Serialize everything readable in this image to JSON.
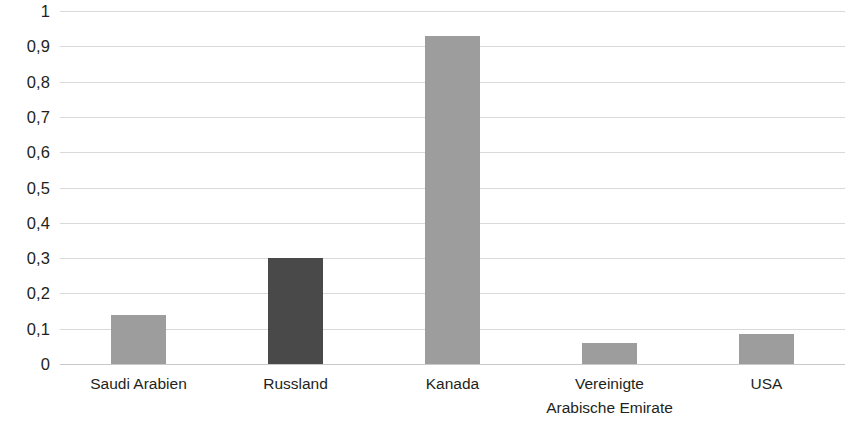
{
  "chart_data": {
    "type": "bar",
    "title": "",
    "subtitle": "",
    "xlabel": "",
    "ylabel": "",
    "categories": [
      "Saudi Arabien",
      "Russland",
      "Kanada",
      "Vereinigte Arabische Emirate",
      "USA"
    ],
    "category_lines": [
      [
        "Saudi Arabien"
      ],
      [
        "Russland"
      ],
      [
        "Kanada"
      ],
      [
        "Vereinigte",
        "Arabische Emirate"
      ],
      [
        "USA"
      ]
    ],
    "values": [
      0.14,
      0.3,
      0.93,
      0.06,
      0.085
    ],
    "bar_colors": [
      "#9d9d9d",
      "#494949",
      "#9d9d9d",
      "#9d9d9d",
      "#9d9d9d"
    ],
    "ylim": [
      0,
      1
    ],
    "ytick_values": [
      1,
      0.9,
      0.8,
      0.7,
      0.6,
      0.5,
      0.4,
      0.3,
      0.2,
      0.1,
      0
    ],
    "ytick_labels": [
      "1",
      "0,9",
      "0,8",
      "0,7",
      "0,6",
      "0,5",
      "0,4",
      "0,3",
      "0,2",
      "0,1",
      "0"
    ],
    "grid": true,
    "gridline_color": "#d9d9d9",
    "legend": null,
    "legend_position": "none",
    "decimal_separator": ","
  }
}
